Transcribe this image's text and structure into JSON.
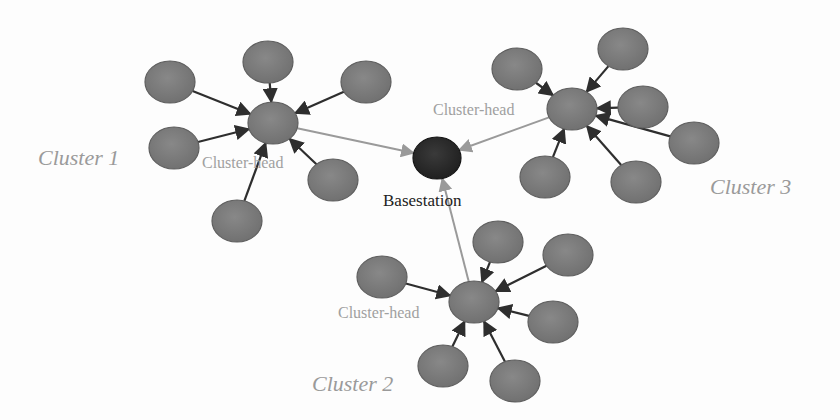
{
  "diagram": {
    "colors": {
      "node_fill": "#7a7a7a",
      "node_stroke": "#5e5e5e",
      "head_fill": "#7c7c7c",
      "basestation_fill": "#2a2a2a",
      "member_arrow": "#2e2e2e",
      "head_arrow": "#9a9a9a",
      "head_label": "#a0a0a0",
      "cluster_label": "#9a9a9a",
      "basestation_label": "#222222"
    },
    "basestation": {
      "label": "Basestation",
      "x": 437,
      "y": 158,
      "rx": 24,
      "ry": 21
    },
    "clusters": [
      {
        "name": "Cluster 1",
        "label": "Cluster 1",
        "label_pos": {
          "x": 38,
          "y": 165
        },
        "head": {
          "label": "Cluster-head",
          "x": 273,
          "y": 123,
          "label_pos": {
            "x": 202,
            "y": 168
          }
        },
        "members": [
          {
            "x": 170,
            "y": 82
          },
          {
            "x": 268,
            "y": 62
          },
          {
            "x": 366,
            "y": 82
          },
          {
            "x": 174,
            "y": 148
          },
          {
            "x": 333,
            "y": 180
          },
          {
            "x": 237,
            "y": 221
          }
        ]
      },
      {
        "name": "Cluster 2",
        "label": "Cluster 2",
        "label_pos": {
          "x": 312,
          "y": 391
        },
        "head": {
          "label": "Cluster-head",
          "x": 474,
          "y": 302,
          "label_pos": {
            "x": 338,
            "y": 318
          }
        },
        "members": [
          {
            "x": 382,
            "y": 277
          },
          {
            "x": 498,
            "y": 242
          },
          {
            "x": 568,
            "y": 255
          },
          {
            "x": 553,
            "y": 322
          },
          {
            "x": 443,
            "y": 366
          },
          {
            "x": 515,
            "y": 381
          }
        ]
      },
      {
        "name": "Cluster 3",
        "label": "Cluster 3",
        "label_pos": {
          "x": 710,
          "y": 194
        },
        "head": {
          "label": "Cluster-head",
          "x": 572,
          "y": 109,
          "label_pos": {
            "x": 433,
            "y": 115
          }
        },
        "members": [
          {
            "x": 517,
            "y": 69
          },
          {
            "x": 623,
            "y": 49
          },
          {
            "x": 643,
            "y": 107
          },
          {
            "x": 694,
            "y": 143
          },
          {
            "x": 545,
            "y": 177
          },
          {
            "x": 636,
            "y": 182
          }
        ]
      }
    ]
  }
}
